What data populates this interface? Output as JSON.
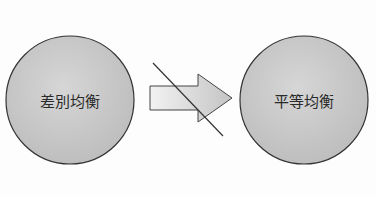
{
  "diagram": {
    "left_node": {
      "label": "差別均衡",
      "shape": "circle"
    },
    "right_node": {
      "label": "平等均衡",
      "shape": "circle"
    },
    "connector": {
      "type": "arrow",
      "direction": "left-to-right",
      "struck_through": true
    },
    "colors": {
      "circle_fill": "#c9c9c9",
      "circle_stroke": "#333333",
      "arrow_shaft_light": "#eeeeee",
      "arrow_head_fill": "#bdbdbd",
      "strike_line": "#333333"
    }
  }
}
